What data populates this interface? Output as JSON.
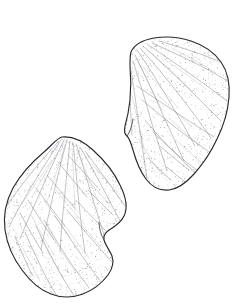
{
  "plate": {
    "title": "Seed specimens line drawing",
    "background_color": "#ffffff",
    "width": 237,
    "height": 306,
    "caption": "",
    "label": ""
  },
  "style": {
    "outline_color": "#2a2a2e",
    "vein_color": "#7b7b84",
    "vein_faint_color": "#9a9aa2",
    "stipple_color": "#6e6e77",
    "fill_color": "#ffffff",
    "outline_width": 1.15
  },
  "specimens": [
    {
      "id": "specimen-upper-right",
      "name": "upper-right-seed",
      "label": "",
      "orientation": "tilted, apex upper-left, base lower-right",
      "bbox": {
        "x": 118,
        "y": 36,
        "width": 112,
        "height": 156
      },
      "outline_path": "M 131 52 C 134 45 143 40 154 38 C 166 36 179 37 191 41 C 203 45 214 52 221 62 C 228 72 230 84 229 97 C 228 111 224 125 217 139 C 211 152 203 164 194 174 C 186 183 177 189 169 190 C 160 191 152 187 146 179 C 140 171 136 161 133 150 C 131 143 129 138 127 136 C 124 134 124 131 125 126 C 127 119 129 110 130 100 C 131 89 131 77 130 66 C 130 59 130 55 131 52 Z",
      "hilum_path": "M 127 136 C 130 132 132 126 133 119",
      "vein_origin": {
        "x": 139,
        "y": 52
      },
      "veins": [
        "M 137 50 C 148 66 160 85 171 104 C 180 119 188 133 195 146",
        "M 140 48 C 153 62 167 79 180 96 C 192 111 202 125 211 138",
        "M 143 46 C 157 58 172 72 186 86 C 199 99 211 111 221 121",
        "M 147 44 C 162 54 178 65 193 76 C 206 85 218 94 227 101",
        "M 135 55 C 144 73 154 94 163 115 C 171 132 178 148 184 161",
        "M 133 61 C 139 80 146 102 152 124 C 158 142 163 158 167 171",
        "M 131 70 C 134 89 137 111 140 132 C 143 150 145 166 147 178",
        "M 152 43 C 168 50 185 58 201 66 C 214 73 225 79 232 84",
        "M 159 41 C 176 46 193 51 208 57 C 219 61 227 65 231 68",
        "M 129 84 C 130 100 131 118 132 135",
        "M 145 120 C 155 132 166 144 177 155 C 186 164 194 172 200 177",
        "M 153 132 C 163 142 174 152 185 161 C 194 168 202 174 208 178",
        "M 160 146 C 169 154 179 162 189 170",
        "M 142 100 C 154 110 167 121 180 131 C 191 139 201 146 209 152",
        "M 137 86 C 150 95 165 105 180 115 C 193 124 205 131 214 137",
        "M 167 167 C 174 173 181 179 188 184",
        "M 148 158 C 155 166 163 173 171 180"
      ],
      "faint_veins": [
        "M 136 58 C 144 74 153 92 162 110",
        "M 150 52 C 163 64 177 77 191 90",
        "M 143 67 C 154 80 166 94 178 108",
        "M 132 96 C 136 113 140 131 144 148",
        "M 157 94 C 168 105 180 116 192 127",
        "M 169 118 C 179 127 190 137 200 146",
        "M 176 140 C 185 148 194 156 203 164",
        "M 139 140 C 146 152 154 164 162 175",
        "M 163 58 C 177 68 192 78 206 89",
        "M 172 48 C 187 56 202 64 216 73"
      ],
      "stipple_density": "medium-high",
      "stipple_seed": 17
    },
    {
      "id": "specimen-lower-left",
      "name": "lower-left-seed",
      "label": "",
      "orientation": "tilted, apex upper-right, base lower-left",
      "bbox": {
        "x": 4,
        "y": 134,
        "width": 125,
        "height": 164
      },
      "outline_path": "M 62 137 C 72 136 83 141 93 150 C 104 160 114 172 120 185 C 126 197 128 208 124 216 C 121 223 114 227 109 230 C 105 233 103 236 104 240 C 106 246 110 251 112 256 C 114 262 113 268 108 275 C 102 283 93 290 83 294 C 72 298 61 298 51 294 C 40 290 30 281 22 270 C 13 258 7 244 5 230 C 3 215 6 201 13 188 C 21 174 32 162 44 152 C 52 145 57 138 62 137 Z",
      "hilum_path": "M 104 240 C 101 235 99 229 99 222",
      "vein_origin": {
        "x": 69,
        "y": 141
      },
      "veins": [
        "M 67 140 C 62 158 57 179 52 200 C 48 218 44 235 41 249",
        "M 70 141 C 68 160 66 182 64 203 C 62 221 61 238 60 252",
        "M 73 142 C 75 161 77 183 79 204 C 81 222 83 239 85 253",
        "M 76 144 C 82 162 88 183 94 203 C 99 219 104 235 108 248",
        "M 64 140 C 56 157 47 176 39 195 C 32 211 25 226 20 239",
        "M 61 140 C 51 155 40 172 30 189 C 22 203 14 216 9 227",
        "M 58 142 C 47 154 35 168 24 182 C 16 193 8 203 4 211",
        "M 80 147 C 89 162 98 179 107 196 C 114 210 121 222 126 232",
        "M 85 151 C 95 164 105 178 115 192 C 122 202 129 211 133 218",
        "M 44 220 C 52 234 61 248 70 262 C 77 272 84 281 89 288",
        "M 36 226 C 43 241 51 256 59 271 C 65 282 71 291 75 297",
        "M 55 216 C 64 229 73 243 82 256 C 89 266 96 275 101 282",
        "M 67 210 C 76 221 86 233 96 244 C 103 252 110 260 115 265",
        "M 78 202 C 87 212 97 222 107 232",
        "M 25 232 C 31 246 38 261 45 275 C 50 285 55 293 58 297",
        "M 15 236 C 20 249 26 262 32 275",
        "M 88 190 C 96 198 105 207 113 215",
        "M 47 175 C 56 186 66 198 76 210",
        "M 36 188 C 45 200 55 213 65 226",
        "M 28 200 C 36 213 45 227 54 240",
        "M 20 213 C 27 226 35 240 43 253",
        "M 58 162 C 67 173 77 185 87 197",
        "M 68 155 C 78 166 88 177 98 188"
      ],
      "faint_veins": [
        "M 65 146 C 59 164 53 183 47 202",
        "M 72 148 C 73 167 74 187 75 206",
        "M 78 152 C 85 169 92 187 99 204",
        "M 59 150 C 50 165 41 181 32 197",
        "M 52 160 C 42 174 32 189 22 204",
        "M 48 229 C 56 243 65 257 74 270",
        "M 40 236 C 47 250 55 264 63 278",
        "M 62 222 C 71 234 80 246 89 258",
        "M 73 215 C 82 225 91 236 100 246",
        "M 31 215 C 38 228 46 242 54 255",
        "M 84 176 C 93 186 102 196 111 206",
        "M 91 163 C 100 173 109 183 117 192",
        "M 23 248 C 28 259 34 270 40 281",
        "M 56 190 C 65 201 75 213 84 224",
        "M 44 200 C 52 212 61 225 70 237"
      ],
      "stipple_density": "high",
      "stipple_seed": 41
    }
  ]
}
